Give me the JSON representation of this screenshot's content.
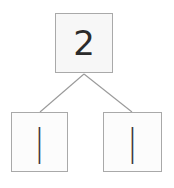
{
  "diagram": {
    "type": "number-bond-tree",
    "background_color": "#ffffff",
    "box_border_color": "#a9a9a9",
    "box_fill_color": "#fcfcfc",
    "edge_color": "#9a9a9a",
    "text_color": "#2b2b2b",
    "root": {
      "label": "2",
      "name": "root-node"
    },
    "children": [
      {
        "label": "|",
        "name": "left-child-node"
      },
      {
        "label": "|",
        "name": "right-child-node"
      }
    ],
    "edges": [
      {
        "name": "edge-root-to-left",
        "from": [
          84,
          74
        ],
        "to": [
          40,
          112
        ]
      },
      {
        "name": "edge-root-to-right",
        "from": [
          84,
          74
        ],
        "to": [
          132,
          112
        ]
      }
    ]
  }
}
